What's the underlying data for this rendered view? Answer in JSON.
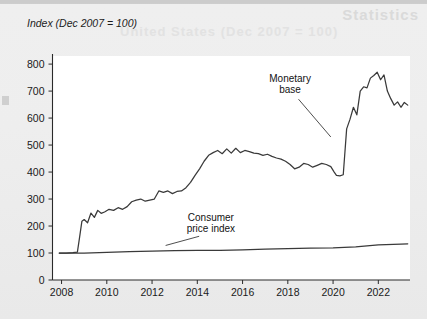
{
  "figure": {
    "axis_title": "Index (Dec 2007 = 100)",
    "ghost_text_top": "Statistics",
    "ghost_text_sub": "United States (Dec 2007 = 100)"
  },
  "chart_data": {
    "type": "line",
    "title": "Index (Dec 2007 = 100)",
    "xlabel": "",
    "ylabel": "Index (Dec 2007 = 100)",
    "xlim": [
      2007.6,
      2023.4
    ],
    "ylim": [
      0,
      830
    ],
    "yticks": [
      0,
      100,
      200,
      300,
      400,
      500,
      600,
      700,
      800
    ],
    "xticks": [
      2008,
      2010,
      2012,
      2014,
      2016,
      2018,
      2020,
      2022
    ],
    "grid": false,
    "legend": "annotations",
    "annotations": [
      {
        "label_line1": "Monetary",
        "label_line2": "base",
        "x": 2018.1,
        "y": 735,
        "points_to_x": 2019.9,
        "points_to_y": 530
      },
      {
        "label_line1": "Consumer",
        "label_line2": "price index",
        "x": 2014.6,
        "y": 218,
        "points_to_x": 2012.6,
        "points_to_y": 128
      }
    ],
    "series": [
      {
        "name": "Monetary base",
        "color": "#3a3a3a",
        "x": [
          2007.9,
          2008.2,
          2008.5,
          2008.7,
          2008.8,
          2008.9,
          2009.0,
          2009.15,
          2009.3,
          2009.45,
          2009.6,
          2009.75,
          2009.9,
          2010.1,
          2010.3,
          2010.5,
          2010.7,
          2010.9,
          2011.1,
          2011.3,
          2011.5,
          2011.7,
          2011.9,
          2012.1,
          2012.3,
          2012.5,
          2012.7,
          2012.9,
          2013.1,
          2013.3,
          2013.5,
          2013.7,
          2013.9,
          2014.1,
          2014.3,
          2014.5,
          2014.7,
          2014.9,
          2015.1,
          2015.3,
          2015.5,
          2015.7,
          2015.9,
          2016.1,
          2016.3,
          2016.5,
          2016.7,
          2016.9,
          2017.1,
          2017.3,
          2017.5,
          2017.7,
          2017.9,
          2018.1,
          2018.3,
          2018.5,
          2018.7,
          2018.9,
          2019.1,
          2019.3,
          2019.5,
          2019.7,
          2019.9,
          2020.05,
          2020.15,
          2020.3,
          2020.45,
          2020.6,
          2020.75,
          2020.9,
          2021.05,
          2021.2,
          2021.35,
          2021.5,
          2021.65,
          2021.8,
          2021.95,
          2022.1,
          2022.25,
          2022.4,
          2022.55,
          2022.7,
          2022.85,
          2023.0,
          2023.15,
          2023.3
        ],
        "y": [
          100,
          100,
          101,
          103,
          160,
          218,
          224,
          212,
          248,
          232,
          258,
          247,
          252,
          262,
          258,
          268,
          262,
          272,
          290,
          296,
          300,
          292,
          296,
          300,
          330,
          325,
          330,
          320,
          328,
          330,
          342,
          362,
          388,
          412,
          440,
          462,
          472,
          480,
          468,
          486,
          470,
          488,
          472,
          480,
          476,
          470,
          468,
          462,
          466,
          458,
          452,
          448,
          440,
          428,
          412,
          418,
          432,
          428,
          418,
          425,
          432,
          428,
          420,
          400,
          388,
          386,
          390,
          560,
          596,
          640,
          612,
          700,
          716,
          712,
          748,
          758,
          770,
          742,
          760,
          700,
          672,
          648,
          660,
          640,
          658,
          648
        ],
        "final_value": 648
      },
      {
        "name": "Consumer price index",
        "color": "#2a2a2a",
        "x": [
          2007.9,
          2009.0,
          2010.0,
          2011.0,
          2012.0,
          2013.0,
          2014.0,
          2015.0,
          2016.0,
          2017.0,
          2018.0,
          2019.0,
          2020.0,
          2021.0,
          2022.0,
          2023.0,
          2023.3
        ],
        "y": [
          100,
          100,
          102,
          105,
          107,
          109,
          110,
          110,
          112,
          114,
          116,
          118,
          119,
          123,
          130,
          133,
          134
        ],
        "final_value": 134
      }
    ]
  },
  "axes": {
    "y_tick_labels": [
      "0",
      "100",
      "200",
      "300",
      "400",
      "500",
      "600",
      "700",
      "800"
    ],
    "x_tick_labels": [
      "2008",
      "2010",
      "2012",
      "2014",
      "2016",
      "2018",
      "2020",
      "2022"
    ]
  }
}
